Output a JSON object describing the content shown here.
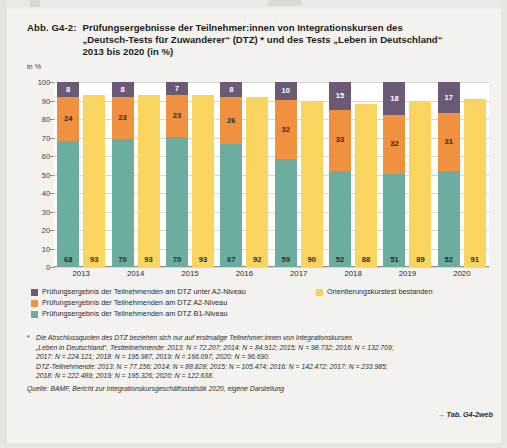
{
  "figure": {
    "number": "Abb. G4-2:",
    "title_lines": [
      "Prüfungsergebnisse der Teilnehmer:innen von Integrationskursen des",
      "„Deutsch-Tests für Zuwanderer“ (DTZ) * und des Tests „Leben in Deutschland“",
      "2013 bis 2020 (in %)"
    ]
  },
  "chart_data": {
    "type": "bar",
    "subtype": "grouped-stacked",
    "title": "Prüfungsergebnisse der Teilnehmer:innen von Integrationskursen des „Deutsch-Tests für Zuwanderer“ (DTZ) * und des Tests „Leben in Deutschland“ 2013 bis 2020 (in %)",
    "xlabel": "",
    "ylabel": "in %",
    "ylim": [
      0,
      100
    ],
    "yticks": [
      0,
      10,
      20,
      30,
      40,
      50,
      60,
      70,
      80,
      90,
      100
    ],
    "grid": true,
    "legend_position": "below",
    "categories": [
      "2013",
      "2014",
      "2015",
      "2016",
      "2017",
      "2018",
      "2019",
      "2020"
    ],
    "series": [
      {
        "name": "Prüfungsergebnis der Teilnehmenden am DTZ B1-Niveau",
        "stack": "dtz",
        "color": "#6cada0",
        "values": [
          68,
          70,
          70,
          67,
          59,
          52,
          51,
          52
        ]
      },
      {
        "name": "Prüfungsergebnis der Teilnehmenden am DTZ A2-Niveau",
        "stack": "dtz",
        "color": "#f0913f",
        "values": [
          24,
          23,
          23,
          26,
          32,
          33,
          32,
          31
        ]
      },
      {
        "name": "Prüfungsergebnis der Teilnehmenden am DTZ unter A2-Niveau",
        "stack": "dtz",
        "color": "#6b5a76",
        "values": [
          8,
          8,
          7,
          8,
          10,
          15,
          18,
          17
        ]
      },
      {
        "name": "Orientierungskurstest bestanden",
        "stack": "ok",
        "color": "#f9d55f",
        "values": [
          93,
          93,
          93,
          92,
          90,
          88,
          89,
          91
        ]
      }
    ]
  },
  "axis": {
    "ylabel": "in %",
    "yticks": [
      "100",
      "90",
      "80",
      "70",
      "60",
      "50",
      "40",
      "30",
      "20",
      "10",
      "0"
    ],
    "years": [
      "2013",
      "2014",
      "2015",
      "2016",
      "2017",
      "2018",
      "2019",
      "2020"
    ]
  },
  "bars": [
    {
      "year": "2013",
      "b1": "68",
      "a2": "24",
      "under_a2": "8",
      "orientation": "93"
    },
    {
      "year": "2014",
      "b1": "70",
      "a2": "23",
      "under_a2": "8",
      "orientation": "93"
    },
    {
      "year": "2015",
      "b1": "70",
      "a2": "23",
      "under_a2": "7",
      "orientation": "93"
    },
    {
      "year": "2016",
      "b1": "67",
      "a2": "26",
      "under_a2": "8",
      "orientation": "92"
    },
    {
      "year": "2017",
      "b1": "59",
      "a2": "32",
      "under_a2": "10",
      "orientation": "90"
    },
    {
      "year": "2018",
      "b1": "52",
      "a2": "33",
      "under_a2": "15",
      "orientation": "88"
    },
    {
      "year": "2019",
      "b1": "51",
      "a2": "32",
      "under_a2": "18",
      "orientation": "89"
    },
    {
      "year": "2020",
      "b1": "52",
      "a2": "31",
      "under_a2": "17",
      "orientation": "91"
    }
  ],
  "legend": {
    "left": [
      {
        "label": "Prüfungsergebnis der Teilnehmenden am DTZ unter A2-Niveau",
        "color": "#6b5a76"
      },
      {
        "label": "Prüfungsergebnis der Teilnehmenden am DTZ A2-Niveau",
        "color": "#f0913f"
      },
      {
        "label": "Prüfungsergebnis der Teilnehmenden am DTZ B1-Niveau",
        "color": "#6cada0"
      }
    ],
    "right": [
      {
        "label": "Orientierungskurstest bestanden",
        "color": "#f9d55f"
      }
    ]
  },
  "notes": {
    "marker": "*",
    "lines": [
      "Die Abschlussquoten des DTZ beziehen sich nur auf erstmalige Teilnehmer:innen von Integrationskursen.",
      "„Leben in Deutschland“, Testteilnehmende: 2013: N = 72.207; 2014: N = 84.912; 2015: N = 98.732; 2016: N = 132.709;",
      "2017: N = 224.121; 2018: N = 195.987, 2019: N = 166.097, 2020: N = 96.690.",
      "DTZ-Teilnehmende: 2013: N = 77.156; 2014: N = 88.828; 2015: N = 105.474; 2016: N = 142.472; 2017: N = 233.985;",
      "2018: N = 222.489; 2019: N = 195.326; 2020: N = 122.638."
    ],
    "source": "Quelle: BAMF, Bericht zur Integrationskursgeschäftsstatistik 2020, eigene Darstellung",
    "table_ref": "→ Tab. G4-2web"
  },
  "colors": {
    "under_a2": "#6b5a76",
    "a2": "#f0913f",
    "b1": "#6cada0",
    "orientation": "#f9d55f"
  }
}
